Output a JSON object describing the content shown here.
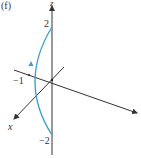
{
  "figure": {
    "panel_label": "(f)",
    "axes": {
      "z_label": "z",
      "x_label": "x",
      "z_ticks": [
        "2",
        "−2"
      ],
      "y_tick": "−1"
    },
    "curve": {
      "color": "#3a9fd0",
      "description": "semicircular arc in the y–z plane from z=2 to z=-2 passing through y=-1, arrow pointing upward"
    },
    "axis_color": "#333333"
  }
}
